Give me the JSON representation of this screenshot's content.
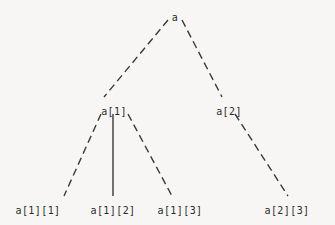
{
  "diagram": {
    "type": "tree",
    "title": "",
    "background_color": "#f7f6f4",
    "line_color": "#3a3a3a",
    "text_color": "#2b2b2b",
    "nodes": [
      {
        "id": "root",
        "label": "a",
        "x": 175,
        "y": 12,
        "level": 0
      },
      {
        "id": "a1",
        "label": "a[1]",
        "x": 114,
        "y": 106,
        "level": 1
      },
      {
        "id": "a2",
        "label": "a[2]",
        "x": 229,
        "y": 106,
        "level": 1
      },
      {
        "id": "a1_1",
        "label": "a[1][1]",
        "x": 38,
        "y": 205,
        "level": 2
      },
      {
        "id": "a1_2",
        "label": "a[1][2]",
        "x": 113,
        "y": 205,
        "level": 2
      },
      {
        "id": "a1_3",
        "label": "a[1][3]",
        "x": 180,
        "y": 205,
        "level": 2
      },
      {
        "id": "a2_3",
        "label": "a[2][3]",
        "x": 287,
        "y": 205,
        "level": 2
      }
    ],
    "edges": [
      {
        "id": "edge-root-a1",
        "from": "root",
        "to": "a1",
        "x1": 168,
        "y1": 20,
        "x2": 104,
        "y2": 97,
        "style": "dashed"
      },
      {
        "id": "edge-root-a2",
        "from": "root",
        "to": "a2",
        "x1": 182,
        "y1": 20,
        "x2": 222,
        "y2": 97,
        "style": "dashed"
      },
      {
        "id": "edge-a1-a1_1",
        "from": "a1",
        "to": "a1_1",
        "x1": 101,
        "y1": 114,
        "x2": 64,
        "y2": 196,
        "style": "dashed"
      },
      {
        "id": "edge-a1-a1_2",
        "from": "a1",
        "to": "a1_2",
        "x1": 113,
        "y1": 114,
        "x2": 113,
        "y2": 196,
        "style": "solid"
      },
      {
        "id": "edge-a1-a1_3",
        "from": "a1",
        "to": "a1_3",
        "x1": 128,
        "y1": 114,
        "x2": 172,
        "y2": 196,
        "style": "dashed"
      },
      {
        "id": "edge-a2-a2_3",
        "from": "a2",
        "to": "a2_3",
        "x1": 235,
        "y1": 114,
        "x2": 288,
        "y2": 196,
        "style": "dashed"
      }
    ]
  }
}
